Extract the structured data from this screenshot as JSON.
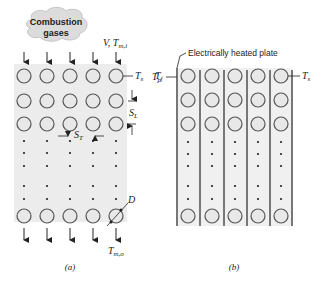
{
  "figure_a": {
    "cloud_label_line1": "Combustion",
    "cloud_label_line2": "gases",
    "inlet_label": "V, T",
    "inlet_label_sub": "m,i",
    "surface_temp": "T",
    "surface_temp_sub": "s",
    "free_temp": "T",
    "free_temp_sub": "f",
    "longitudinal_pitch": "S",
    "longitudinal_pitch_sub": "L",
    "transverse_pitch": "S",
    "transverse_pitch_sub": "T",
    "diameter": "D",
    "outlet_label": "T",
    "outlet_label_sub": "m,o",
    "caption": "(a)"
  },
  "figure_b": {
    "plate_label": "Electrically heated plate",
    "plate_temp": "T",
    "plate_temp_sub": "p",
    "surface_temp": "T",
    "surface_temp_sub": "s",
    "caption": "(b)"
  },
  "colors": {
    "panel_fill": "#ececec",
    "tube_stroke": "#555555",
    "plate": "#777777",
    "text": "#222222"
  }
}
